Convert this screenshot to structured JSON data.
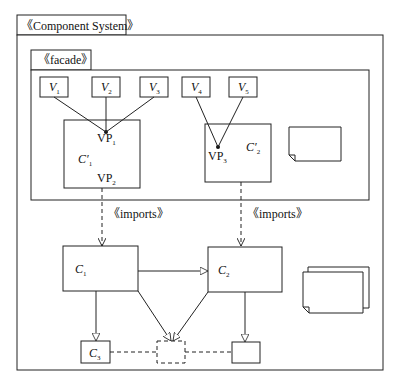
{
  "package_outer": {
    "label": "《Component System》"
  },
  "package_facade": {
    "label": "《facade》"
  },
  "variants": [
    {
      "name": "V",
      "sub": "1"
    },
    {
      "name": "V",
      "sub": "2"
    },
    {
      "name": "V",
      "sub": "3"
    },
    {
      "name": "V",
      "sub": "4"
    },
    {
      "name": "V",
      "sub": "5"
    }
  ],
  "facade_components": [
    {
      "name": "C′",
      "sub": "1",
      "points": [
        {
          "name": "VP",
          "sub": "1"
        },
        {
          "name": "VP",
          "sub": "2"
        }
      ]
    },
    {
      "name": "C′",
      "sub": "2",
      "points": [
        {
          "name": "VP",
          "sub": "3"
        }
      ]
    }
  ],
  "imports": [
    {
      "label": "《imports》"
    },
    {
      "label": "《imports》"
    }
  ],
  "components": [
    {
      "name": "C",
      "sub": "1"
    },
    {
      "name": "C",
      "sub": "2"
    },
    {
      "name": "C",
      "sub": "3"
    }
  ]
}
